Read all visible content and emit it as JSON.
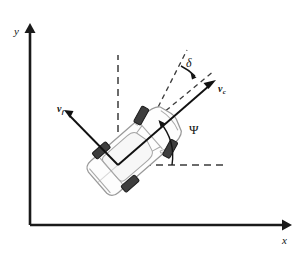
{
  "figure": {
    "background_color": "#ffffff",
    "width": 305,
    "height": 260
  },
  "axes": {
    "x_label": "x",
    "y_label": "y",
    "origin_px": [
      30,
      225
    ],
    "x_tip_px": [
      287,
      225
    ],
    "y_tip_px": [
      30,
      27
    ],
    "color": "#1a1a1a"
  },
  "vectors": [
    {
      "id": "vc",
      "label_base": "v",
      "label_sub": "c",
      "description": "velocity of vehicle center",
      "from_px": [
        118,
        165
      ],
      "to_px": [
        215,
        81
      ],
      "color": "#111111"
    },
    {
      "id": "vf",
      "label_base": "v",
      "label_sub": "f",
      "description": "velocity of front wheel",
      "from_px": [
        118,
        165
      ],
      "to_px": [
        65,
        111
      ],
      "color": "#111111"
    }
  ],
  "angles": [
    {
      "id": "delta",
      "symbol": "δ",
      "description": "front wheel steering angle",
      "label_px": [
        189,
        62
      ],
      "vertex_px": [
        172,
        115
      ]
    },
    {
      "id": "psi",
      "symbol": "Ψ",
      "description": "vehicle heading / yaw angle",
      "label_px": [
        190,
        129
      ],
      "vertex_px": [
        118,
        165
      ]
    }
  ],
  "reference_lines": [
    {
      "id": "vertical-dashed",
      "description": "vertical reference through vehicle center",
      "from_px": [
        118,
        165
      ],
      "to_px": [
        118,
        55
      ],
      "style": "dashed"
    },
    {
      "id": "horizontal-dashed",
      "description": "horizontal reference for heading angle",
      "from_px": [
        118,
        165
      ],
      "to_px": [
        225,
        165
      ],
      "style": "dashed"
    },
    {
      "id": "steer-dashed",
      "description": "front wheel direction reference",
      "from_px": [
        150,
        122
      ],
      "to_px": [
        186,
        51
      ],
      "style": "dashed"
    },
    {
      "id": "body-axis-dashed",
      "description": "vehicle longitudinal axis extension",
      "from_px": [
        150,
        122
      ],
      "to_px": [
        213,
        72
      ],
      "style": "dashed"
    }
  ],
  "vehicle": {
    "description": "top view of a car rotated counter-clockwise",
    "heading_deg": 41,
    "body_color": "#fdfdfd",
    "outline_color": "#9a9a9a",
    "wheel_color": "#3e3e3e",
    "wheels": [
      {
        "id": "front-left",
        "steered": true
      },
      {
        "id": "front-right",
        "steered": true
      },
      {
        "id": "rear-left",
        "steered": false
      },
      {
        "id": "rear-right",
        "steered": false
      }
    ]
  }
}
